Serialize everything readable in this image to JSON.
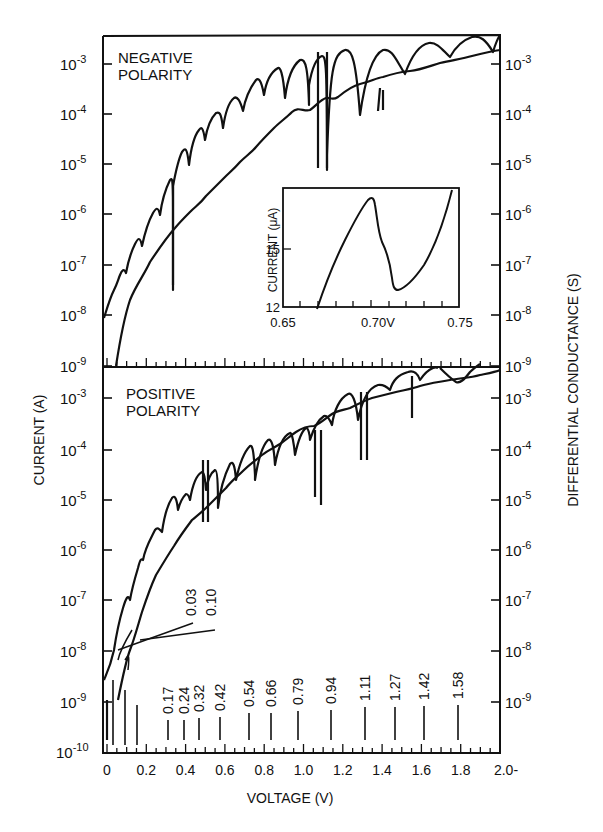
{
  "chart_data": [
    {
      "panel": "top",
      "type": "line",
      "title": "NEGATIVE POLARITY",
      "xlabel": "VOLTAGE (V)",
      "ylabel_left": "CURRENT (A)",
      "ylabel_right": "DIFFERENTIAL CONDUCTANCE (S)",
      "yscale": "log",
      "ylim": [
        1e-09,
        0.001
      ],
      "xlim": [
        0,
        2.0
      ],
      "left_tick_labels": [
        "10^-3",
        "10^-4",
        "10^-5",
        "10^-6",
        "10^-7",
        "10^-8",
        "10^-9"
      ],
      "right_tick_labels": [
        "10^-3",
        "10^-4",
        "10^-5",
        "10^-6",
        "10^-7",
        "10^-8",
        "10^-9"
      ],
      "series": [
        {
          "name": "Differential conductance (oscillatory curve)",
          "x": [
            0.0,
            0.05,
            0.1,
            0.15,
            0.2,
            0.25,
            0.3,
            0.35,
            0.4,
            0.45,
            0.5,
            0.55,
            0.6,
            0.65,
            0.7,
            0.75,
            0.8,
            0.9,
            1.0,
            1.1,
            1.2,
            1.3,
            1.4,
            1.5,
            1.6,
            1.7,
            1.8,
            1.9,
            2.0
          ],
          "y": [
            1e-08,
            5e-08,
            1.5e-07,
            5e-07,
            1e-06,
            3e-06,
            8e-06,
            5e-06,
            1.5e-05,
            4e-05,
            8e-05,
            0.0001,
            0.0002,
            0.0003,
            0.0005,
            0.0003,
            0.0007,
            0.001,
            0.001,
            0.001,
            0.0012,
            0.0013,
            0.0013,
            0.0013,
            0.0015,
            0.0013,
            0.0015,
            0.0016,
            0.002
          ]
        },
        {
          "name": "Current (smooth monotonic curve)",
          "x": [
            0.05,
            0.1,
            0.2,
            0.3,
            0.4,
            0.5,
            0.6,
            0.7,
            0.8,
            0.9,
            1.0,
            1.1,
            1.2,
            1.4,
            1.6,
            1.8,
            2.0
          ],
          "y": [
            1e-09,
            1e-08,
            8e-08,
            5e-07,
            1.5e-06,
            4e-06,
            1e-05,
            2.5e-05,
            5e-05,
            0.0001,
            0.00011,
            0.0002,
            0.0002,
            0.0004,
            0.0006,
            0.001,
            0.0015
          ]
        }
      ],
      "dips_v": [
        0.33,
        0.45,
        0.55,
        0.66,
        0.79,
        0.94,
        1.08,
        1.13,
        1.3,
        1.55,
        1.8
      ],
      "inset": {
        "type": "line",
        "xlabel_ticks": [
          "0.65",
          "0.70V",
          "0.75"
        ],
        "ylabel": "CURRENT (μA)",
        "y_tick_labels": [
          "12",
          "15"
        ],
        "xlim": [
          0.65,
          0.75
        ],
        "ylim": [
          12,
          17.5
        ],
        "x": [
          0.668,
          0.675,
          0.685,
          0.695,
          0.699,
          0.702,
          0.706,
          0.71,
          0.713,
          0.716,
          0.725,
          0.735,
          0.745
        ],
        "y": [
          12.1,
          13.6,
          15.5,
          16.9,
          17.2,
          16.5,
          15.0,
          14.5,
          13.3,
          13.0,
          13.5,
          14.8,
          17.0
        ],
        "note": "Negative differential resistance region"
      }
    },
    {
      "panel": "bottom",
      "type": "line",
      "title": "POSITIVE POLARITY",
      "xlabel": "VOLTAGE (V)",
      "ylabel_left": "CURRENT (A)",
      "ylabel_right": "DIFFERENTIAL CONDUCTANCE (S)",
      "yscale": "log",
      "ylim": [
        1e-10,
        0.001
      ],
      "xlim": [
        0,
        2.0
      ],
      "x_tick_labels": [
        "0",
        "0.2",
        "0.4",
        "0.6",
        "0.8",
        "1.0",
        "1.2",
        "1.4",
        "1.6",
        "1.8",
        "2.0-"
      ],
      "left_tick_labels": [
        "10^-3",
        "10^-4",
        "10^-5",
        "10^-6",
        "10^-7",
        "10^-8",
        "10^-9",
        "10^-10"
      ],
      "right_tick_labels": [
        "10^-3",
        "10^-4",
        "10^-5",
        "10^-6",
        "10^-7",
        "10^-8",
        "10^-9"
      ],
      "series": [
        {
          "name": "Differential conductance (oscillatory curve)",
          "x": [
            0.0,
            0.05,
            0.1,
            0.15,
            0.2,
            0.25,
            0.3,
            0.35,
            0.42,
            0.5,
            0.55,
            0.66,
            0.79,
            0.94,
            1.1,
            1.27,
            1.42,
            1.58,
            1.8,
            2.0
          ],
          "y": [
            3e-09,
            5e-09,
            5e-08,
            2e-07,
            5e-07,
            1e-06,
            2e-06,
            1e-05,
            3e-05,
            8e-05,
            0.00015,
            0.0003,
            0.0005,
            0.0008,
            0.001,
            0.0012,
            0.0015,
            0.0018,
            0.002,
            0.003
          ]
        },
        {
          "name": "Current (smooth monotonic curve)",
          "x": [
            0.05,
            0.1,
            0.2,
            0.3,
            0.4,
            0.5,
            0.6,
            0.7,
            0.8,
            1.0,
            1.2,
            1.4,
            1.6,
            1.8,
            2.0
          ],
          "y": [
            1e-09,
            8e-09,
            1e-07,
            5e-07,
            2e-06,
            5e-06,
            1.5e-05,
            3e-05,
            6e-05,
            0.00012,
            0.00025,
            0.0004,
            0.0007,
            0.0012,
            0.002
          ]
        }
      ],
      "annotations": {
        "line_labels": [
          "0.03",
          "0.10"
        ],
        "peak_voltage_labels": [
          "0.17",
          "0.24",
          "0.32",
          "0.42",
          "0.54",
          "0.66",
          "0.79",
          "0.94",
          "1.11",
          "1.27",
          "1.42",
          "1.58"
        ]
      }
    }
  ],
  "labels": {
    "top_title_line1": "NEGATIVE",
    "top_title_line2": "POLARITY",
    "bottom_title_line1": "POSITIVE",
    "bottom_title_line2": "POLARITY",
    "ylabel_left": "CURRENT (A)",
    "ylabel_right": "DIFFERENTIAL CONDUCTANCE (S)",
    "xlabel": "VOLTAGE (V)",
    "inset_ylabel": "CURRENT (μA)",
    "inset_x_ticks": [
      "0.65",
      "0.70V",
      "0.75"
    ],
    "inset_y_ticks": [
      "15",
      "12"
    ],
    "x_ticks": [
      "0",
      "0.2",
      "0.4",
      "0.6",
      "0.8",
      "1.0",
      "1.2",
      "1.4",
      "1.6",
      "1.8",
      "2.0-"
    ],
    "top_left_exps": [
      "-3",
      "-4",
      "-5",
      "-6",
      "-7",
      "-8",
      "-9"
    ],
    "top_right_exps": [
      "-3",
      "-4",
      "-5",
      "-6",
      "-7",
      "-8",
      "-9"
    ],
    "bot_left_exps": [
      "-3",
      "-4",
      "-5",
      "-6",
      "-7",
      "-8",
      "-9",
      "-10"
    ],
    "bot_right_exps": [
      "-3",
      "-4",
      "-5",
      "-6",
      "-7",
      "-8",
      "-9"
    ],
    "base": "10",
    "line_label_a": "0.03",
    "line_label_b": "0.10",
    "peaks": [
      "0.17",
      "0.24",
      "0.32",
      "0.42",
      "0.54",
      "0.66",
      "0.79",
      "0.94",
      "1.11",
      "1.27",
      "1.42",
      "1.58"
    ]
  }
}
